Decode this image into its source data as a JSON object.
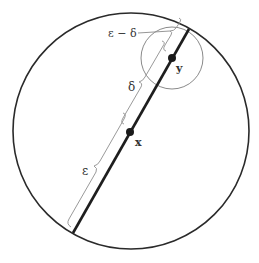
{
  "diagram": {
    "type": "geometric-ball-illustration",
    "labels": {
      "point_x": "x",
      "point_y": "y",
      "epsilon": "ε",
      "delta": "δ",
      "epsilon_minus_delta": "ε − δ"
    },
    "colors": {
      "outline": "#2a2a2a",
      "thin": "#8a8a8a",
      "brace": "#9a9a9a",
      "text": "#333333"
    }
  }
}
